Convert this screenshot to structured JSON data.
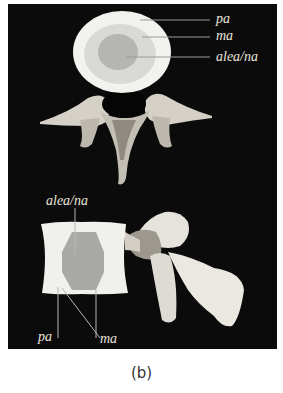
{
  "figure": {
    "caption": "(b)",
    "background_color": "#0b0b0b",
    "top_view": {
      "labels": [
        {
          "id": "pa",
          "text": "pa"
        },
        {
          "id": "ma",
          "text": "ma"
        },
        {
          "id": "alea_na",
          "text": "alea/na"
        }
      ],
      "colors": {
        "outer_ring": "#f2f2ee",
        "middle_ring": "#d9d9d6",
        "core": "#b5b5b3"
      }
    },
    "side_view": {
      "labels": [
        {
          "id": "alea_na",
          "text": "alea/na"
        },
        {
          "id": "pa",
          "text": "pa"
        },
        {
          "id": "ma",
          "text": "ma"
        }
      ],
      "colors": {
        "block": "#f0f0ec",
        "core": "#a9a9a6"
      }
    }
  }
}
